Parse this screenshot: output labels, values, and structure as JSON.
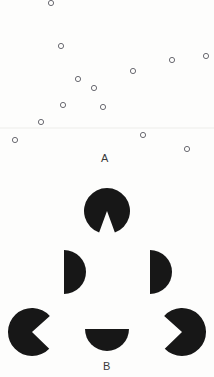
{
  "figure": {
    "background_color": "#fdfdfc",
    "width": 214,
    "height": 377
  },
  "panel_a": {
    "label": "A",
    "label_x": 105,
    "label_y": 158,
    "marker_style": "open-circle",
    "marker_radius": 2.6,
    "marker_stroke_color": "#6b6b72",
    "divider_line": {
      "y": 128,
      "color": "#ededea"
    },
    "points": [
      {
        "x": 51,
        "y": 3
      },
      {
        "x": 61,
        "y": 46
      },
      {
        "x": 172,
        "y": 60
      },
      {
        "x": 206,
        "y": 56
      },
      {
        "x": 133,
        "y": 71
      },
      {
        "x": 78,
        "y": 79
      },
      {
        "x": 94,
        "y": 88
      },
      {
        "x": 63,
        "y": 105
      },
      {
        "x": 103,
        "y": 107
      },
      {
        "x": 41,
        "y": 122
      },
      {
        "x": 15,
        "y": 140
      },
      {
        "x": 143,
        "y": 135
      },
      {
        "x": 187,
        "y": 149
      }
    ]
  },
  "panel_b": {
    "label": "B",
    "label_x": 107,
    "label_y": 366,
    "shape_color": "#171717",
    "shape_type": "pacman-disc",
    "discs": [
      {
        "name": "top-disc",
        "cx": 107,
        "cy": 211,
        "r": 23,
        "wedge_start_deg": 70,
        "wedge_end_deg": 110,
        "notch_direction": "down"
      },
      {
        "name": "middle-left-disc",
        "cx": 64,
        "cy": 272,
        "r": 22,
        "wedge_start_deg": 90,
        "wedge_end_deg": 270,
        "notch_direction": "left"
      },
      {
        "name": "middle-right-disc",
        "cx": 150,
        "cy": 272,
        "r": 22,
        "wedge_start_deg": 90,
        "wedge_end_deg": 270,
        "notch_direction": "left"
      },
      {
        "name": "bottom-left-disc",
        "cx": 32,
        "cy": 332,
        "r": 24,
        "wedge_start_deg": 318,
        "wedge_end_deg": 44,
        "notch_direction": "upper-right"
      },
      {
        "name": "bottom-center-disc",
        "cx": 107,
        "cy": 329,
        "r": 22,
        "wedge_start_deg": 180,
        "wedge_end_deg": 360,
        "notch_direction": "up"
      },
      {
        "name": "bottom-right-disc",
        "cx": 182,
        "cy": 332,
        "r": 24,
        "wedge_start_deg": 136,
        "wedge_end_deg": 222,
        "notch_direction": "upper-left"
      }
    ]
  }
}
